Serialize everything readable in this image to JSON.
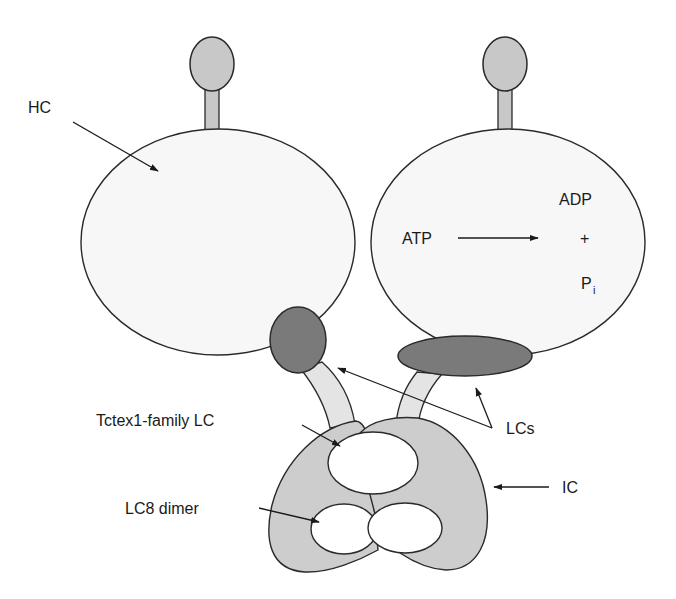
{
  "colors": {
    "background": "#ffffff",
    "stroke": "#2a2a2a",
    "motor_fill": "#f7f7f7",
    "stalk_fill": "#c8c8c8",
    "lc_dark_fill": "#7a7a7a",
    "ic_fill": "#cdcdcd",
    "stem_fill": "#e4e4e4",
    "oval_fill": "#ffffff"
  },
  "labels": {
    "hc": "HC",
    "atp": "ATP",
    "adp": "ADP",
    "plus": "+",
    "pi_main": "P",
    "pi_sub": "i",
    "tctex": "Tctex1-family LC",
    "lc8": "LC8 dimer",
    "lcs": "LCs",
    "ic": "IC"
  },
  "components": [
    {
      "id": "heavy-chain-left",
      "label": "HC"
    },
    {
      "id": "heavy-chain-right",
      "label": "HC"
    },
    {
      "id": "light-chains",
      "label": "LCs"
    },
    {
      "id": "intermediate-chain",
      "label": "IC"
    },
    {
      "id": "tctex1-light-chain",
      "label": "Tctex1-family LC"
    },
    {
      "id": "lc8-dimer",
      "label": "LC8 dimer"
    }
  ],
  "reaction": {
    "substrate": "ATP",
    "products": [
      "ADP",
      "Pi"
    ]
  }
}
